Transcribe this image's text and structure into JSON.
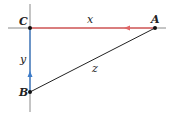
{
  "diagram": {
    "type": "right-triangle",
    "points": {
      "C": {
        "label": "C"
      },
      "A": {
        "label": "A"
      },
      "B": {
        "label": "B"
      }
    },
    "sides": {
      "x": {
        "label": "x",
        "from": "A",
        "to": "C",
        "color": "#e06666"
      },
      "y": {
        "label": "y",
        "from": "B",
        "to": "C",
        "color": "#3d7cc9"
      },
      "z": {
        "label": "z",
        "from": "A",
        "to": "B",
        "color": "#222222"
      }
    },
    "axis_color": "#888888"
  }
}
